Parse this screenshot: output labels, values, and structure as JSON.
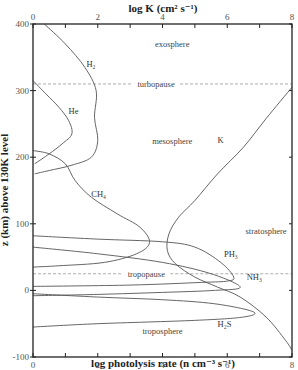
{
  "chart_data": {
    "type": "line",
    "top_axis": {
      "label": "log K (cm² s⁻¹)",
      "ticks": [
        "0",
        "2",
        "4",
        "6",
        "8"
      ],
      "range": [
        0,
        8
      ]
    },
    "bottom_axis": {
      "label": "log photolysis rate (n cm⁻³ s⁻¹)",
      "ticks": [
        "0",
        "2",
        "4",
        "6",
        "8"
      ],
      "range": [
        0,
        8
      ]
    },
    "y_axis": {
      "label": "z (km) above 130K level",
      "ticks": [
        "400",
        "300",
        "200",
        "100",
        "0",
        "-100"
      ],
      "range": [
        -100,
        400
      ]
    },
    "reference_lines": [
      {
        "name": "turbopause",
        "z": 310
      },
      {
        "name": "tropopause",
        "z": 25
      }
    ],
    "regions": [
      {
        "label": "exosphere",
        "x": 4.3,
        "z": 365
      },
      {
        "label": "mesosphere",
        "x": 4.3,
        "z": 220
      },
      {
        "label": "stratosphere",
        "x": 7.2,
        "z": 85
      },
      {
        "label": "troposphere",
        "x": 4.0,
        "z": -65
      }
    ],
    "series": [
      {
        "name": "K",
        "label": "K",
        "label_at": [
          5.7,
          222
        ],
        "points": [
          [
            8,
            305
          ],
          [
            7.2,
            258
          ],
          [
            6.5,
            215
          ],
          [
            5.7,
            175
          ],
          [
            5.0,
            135
          ],
          [
            4.5,
            110
          ],
          [
            4.2,
            85
          ],
          [
            4.15,
            60
          ],
          [
            4.4,
            40
          ],
          [
            5.0,
            20
          ],
          [
            5.7,
            5
          ],
          [
            6.4,
            -10
          ],
          [
            7.2,
            -40
          ],
          [
            7.8,
            -75
          ],
          [
            8,
            -90
          ]
        ]
      },
      {
        "name": "H2",
        "label": "H₂",
        "label_at": [
          1.65,
          335
        ],
        "points": [
          [
            0.35,
            400
          ],
          [
            1.0,
            370
          ],
          [
            1.6,
            335
          ],
          [
            1.95,
            300
          ],
          [
            1.9,
            260
          ],
          [
            2.0,
            225
          ],
          [
            1.8,
            200
          ],
          [
            1.2,
            188
          ],
          [
            0.5,
            180
          ],
          [
            0.05,
            175
          ]
        ]
      },
      {
        "name": "He",
        "label": "He",
        "label_at": [
          1.1,
          265
        ],
        "points": [
          [
            0,
            315
          ],
          [
            0.4,
            295
          ],
          [
            0.8,
            275
          ],
          [
            1.1,
            255
          ],
          [
            1.2,
            235
          ],
          [
            0.9,
            220
          ],
          [
            0.5,
            205
          ],
          [
            0.05,
            190
          ]
        ]
      },
      {
        "name": "CH4",
        "label": "CH₄",
        "label_at": [
          1.8,
          140
        ],
        "points": [
          [
            0,
            210
          ],
          [
            0.5,
            205
          ],
          [
            1.0,
            190
          ],
          [
            1.3,
            165
          ],
          [
            1.8,
            140
          ],
          [
            2.6,
            115
          ],
          [
            3.3,
            95
          ],
          [
            3.6,
            72
          ],
          [
            3.2,
            55
          ],
          [
            2.2,
            42
          ],
          [
            0.8,
            37
          ],
          [
            0,
            35
          ]
        ]
      },
      {
        "name": "PH3",
        "label": "PH₃",
        "label_at": [
          5.9,
          50
        ],
        "points": [
          [
            0,
            82
          ],
          [
            2,
            77
          ],
          [
            4,
            73
          ],
          [
            5,
            65
          ],
          [
            5.8,
            42
          ],
          [
            6.2,
            20
          ],
          [
            6.0,
            14
          ],
          [
            5.2,
            12
          ],
          [
            3,
            8
          ],
          [
            0,
            6
          ]
        ]
      },
      {
        "name": "NH3",
        "label": "NH₃",
        "label_at": [
          6.6,
          15
        ],
        "points": [
          [
            0,
            65
          ],
          [
            2,
            55
          ],
          [
            4,
            42
          ],
          [
            5.5,
            25
          ],
          [
            6.4,
            5
          ],
          [
            5.6,
            0
          ],
          [
            4,
            -3
          ],
          [
            2,
            -6
          ],
          [
            0,
            -8
          ]
        ]
      },
      {
        "name": "H2S",
        "label": "H₂S",
        "label_at": [
          5.7,
          -55
        ],
        "points": [
          [
            0,
            -5
          ],
          [
            2,
            -10
          ],
          [
            4,
            -14
          ],
          [
            5.6,
            -20
          ],
          [
            6.8,
            -32
          ],
          [
            6.5,
            -40
          ],
          [
            5,
            -45
          ],
          [
            2,
            -50
          ],
          [
            0,
            -55
          ]
        ]
      }
    ]
  }
}
